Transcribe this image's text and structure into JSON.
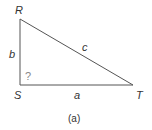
{
  "diagram": {
    "type": "right-triangle",
    "vertices": [
      {
        "name": "R",
        "x": 20,
        "y": 19
      },
      {
        "name": "S",
        "x": 20,
        "y": 85
      },
      {
        "name": "T",
        "x": 133,
        "y": 85
      }
    ],
    "sides": [
      {
        "label": "b",
        "from": "R",
        "to": "S"
      },
      {
        "label": "a",
        "from": "S",
        "to": "T"
      },
      {
        "label": "c",
        "from": "R",
        "to": "T"
      }
    ],
    "angle_marker": "?",
    "caption": "(a)",
    "line_color": "#555555"
  },
  "labels": {
    "R": "R",
    "S": "S",
    "T": "T",
    "a": "a",
    "b": "b",
    "c": "c",
    "angle": "?",
    "caption": "(a)"
  }
}
